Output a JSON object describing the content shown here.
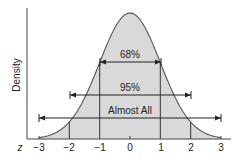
{
  "chart_data": {
    "type": "area",
    "title": "",
    "xlabel": "z",
    "ylabel": "Density",
    "x_ticks": [
      "-3",
      "-2",
      "-1",
      "0",
      "1",
      "2",
      "3"
    ],
    "xlim": [
      -3,
      3
    ],
    "grid": false,
    "legend": "none",
    "series": [
      {
        "name": "Standard normal density",
        "distribution": "normal",
        "mean": 0,
        "sd": 1
      }
    ],
    "annotations": [
      {
        "label": "68%",
        "from": -1,
        "to": 1
      },
      {
        "label": "95%",
        "from": -2,
        "to": 2
      },
      {
        "label": "Almost All",
        "from": -3,
        "to": 3
      }
    ],
    "vertical_lines": [
      -2,
      -1,
      1,
      2
    ],
    "colors": {
      "fill": "#d9d9d9",
      "line": "#333333"
    }
  },
  "labels": {
    "z": "z",
    "ylabel": "Density",
    "t0": "−3",
    "t1": "−2",
    "t2": "−1",
    "t3": "0",
    "t4": "1",
    "t5": "2",
    "t6": "3",
    "a68": "68%",
    "a95": "95%",
    "aall": "Almost All"
  }
}
